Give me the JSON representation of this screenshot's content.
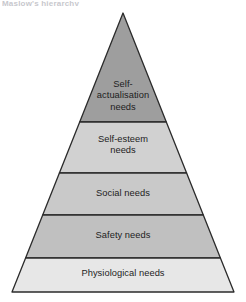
{
  "figure": {
    "type": "pyramid-diagram",
    "caption_remnant": "Maslow's hierarchy",
    "background_color": "#ffffff",
    "outline_color": "#2b2b2b",
    "text_color": "#1d1d1d"
  },
  "pyramid": {
    "apex": {
      "x": 123,
      "y": 13
    },
    "base_left": {
      "x": 12,
      "y": 292
    },
    "base_right": {
      "x": 234,
      "y": 292
    },
    "divider_y": [
      122,
      173,
      215,
      258
    ],
    "tiers": [
      {
        "rank": 1,
        "position": "top",
        "label": "Self-\nactualisation\nneeds",
        "fill": "#9e9e9e",
        "top_y": 13,
        "bottom_y": 122
      },
      {
        "rank": 2,
        "position": "second",
        "label": "Self-esteem\nneeds",
        "fill": "#d1d1d1",
        "top_y": 122,
        "bottom_y": 173
      },
      {
        "rank": 3,
        "position": "middle",
        "label": "Social needs",
        "fill": "#c9c9c9",
        "top_y": 173,
        "bottom_y": 215
      },
      {
        "rank": 4,
        "position": "fourth",
        "label": "Safety needs",
        "fill": "#c0c0c0",
        "top_y": 215,
        "bottom_y": 258
      },
      {
        "rank": 5,
        "position": "base",
        "label": "Physiological needs",
        "fill": "#e7e7e7",
        "top_y": 258,
        "bottom_y": 292
      }
    ]
  }
}
